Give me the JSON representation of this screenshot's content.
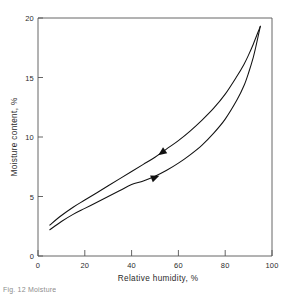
{
  "figure": {
    "caption_fragment": "Fig. 12  Moisture"
  },
  "chart_data": {
    "type": "line",
    "title": "",
    "subtitle": "",
    "xlabel": "Relative  humidity, %",
    "ylabel": "Moisture   content, %",
    "xlim": [
      0,
      100
    ],
    "ylim": [
      0,
      20
    ],
    "xticks": [
      0,
      20,
      40,
      60,
      80,
      100
    ],
    "yticks": [
      0,
      5,
      10,
      15,
      20
    ],
    "xtick_labels": [
      "0",
      "20",
      "40",
      "60",
      "80",
      "100"
    ],
    "ytick_labels": [
      "0",
      "5",
      "10",
      "15",
      "20"
    ],
    "grid": false,
    "legend": false,
    "legend_position": "none",
    "frame": "full-box",
    "series": [
      {
        "name": "Desorption (upper branch)",
        "direction_marker": "arrow-left",
        "marker_at": {
          "x": 53,
          "y": 8.7
        },
        "x": [
          5,
          10,
          15,
          20,
          25,
          30,
          35,
          40,
          45,
          50,
          55,
          60,
          65,
          70,
          75,
          80,
          85,
          88,
          90,
          92,
          93,
          94,
          95
        ],
        "y": [
          2.6,
          3.4,
          4.1,
          4.7,
          5.3,
          5.9,
          6.5,
          7.1,
          7.7,
          8.3,
          9.0,
          9.7,
          10.5,
          11.4,
          12.4,
          13.6,
          15.1,
          16.1,
          16.9,
          17.8,
          18.3,
          18.8,
          19.3
        ]
      },
      {
        "name": "Adsorption (lower branch)",
        "direction_marker": "arrow-right",
        "marker_at": {
          "x": 50,
          "y": 6.6
        },
        "x": [
          5,
          10,
          15,
          20,
          25,
          30,
          35,
          40,
          45,
          50,
          55,
          60,
          65,
          70,
          75,
          80,
          85,
          88,
          90,
          92,
          93,
          94,
          95
        ],
        "y": [
          2.2,
          2.9,
          3.5,
          4.0,
          4.5,
          5.0,
          5.5,
          6.0,
          6.3,
          6.7,
          7.2,
          7.8,
          8.5,
          9.3,
          10.3,
          11.5,
          13.1,
          14.3,
          15.4,
          16.7,
          17.5,
          18.4,
          19.3
        ]
      }
    ],
    "annotations": [
      {
        "name": "desorption-arrow",
        "glyph": "left-triangle",
        "x": 53,
        "y": 8.7
      },
      {
        "name": "adsorption-arrow",
        "glyph": "right-triangle",
        "x": 50,
        "y": 6.6
      }
    ]
  },
  "colors": {
    "curve": "#111111",
    "axis": "#555555",
    "text": "#2b2b2b",
    "background": "#ffffff"
  }
}
